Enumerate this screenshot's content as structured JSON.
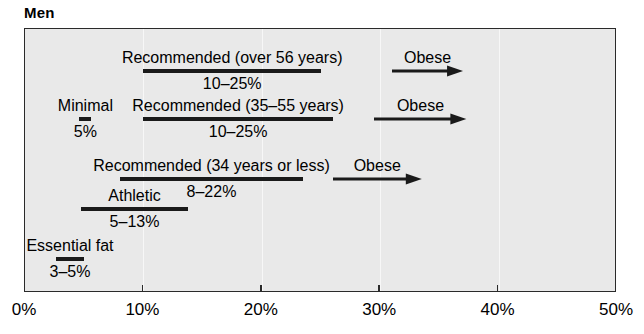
{
  "chart_data": {
    "type": "bar",
    "title": "Men",
    "xlabel": "",
    "ylabel": "",
    "xlim": [
      0,
      50
    ],
    "grid": true,
    "legend": "none",
    "orientation": "horizontal-ranges",
    "xtick_labels": [
      "0%",
      "10%",
      "20%",
      "30%",
      "40%",
      "50%"
    ],
    "xtick_values": [
      0,
      10,
      20,
      30,
      40,
      50
    ],
    "ranges": [
      {
        "label": "Recommended (over 56 years)",
        "value_label": "10–25%",
        "start": 10,
        "end": 25,
        "row": 0
      },
      {
        "label": "Recommended (35–55 years)",
        "value_label": "10–25%",
        "start": 10,
        "end": 26,
        "row": 1
      },
      {
        "label": "Minimal",
        "value_label": "5%",
        "start": 4.6,
        "end": 5.6,
        "row": 1
      },
      {
        "label": "Recommended (34 years or less)",
        "value_label": "8–22%",
        "start": 8,
        "end": 23.5,
        "row": 2
      },
      {
        "label": "Athletic",
        "value_label": "5–13%",
        "start": 4.7,
        "end": 13.8,
        "row": 3
      },
      {
        "label": "Essential fat",
        "value_label": "3–5%",
        "start": 2.6,
        "end": 5,
        "row": 4
      }
    ],
    "arrows": [
      {
        "label": "Obese",
        "start": 31,
        "end": 37,
        "row": 0
      },
      {
        "label": "Obese",
        "start": 29.5,
        "end": 37.3,
        "row": 1
      },
      {
        "label": "Obese",
        "start": 26,
        "end": 33.5,
        "row": 2
      }
    ]
  }
}
